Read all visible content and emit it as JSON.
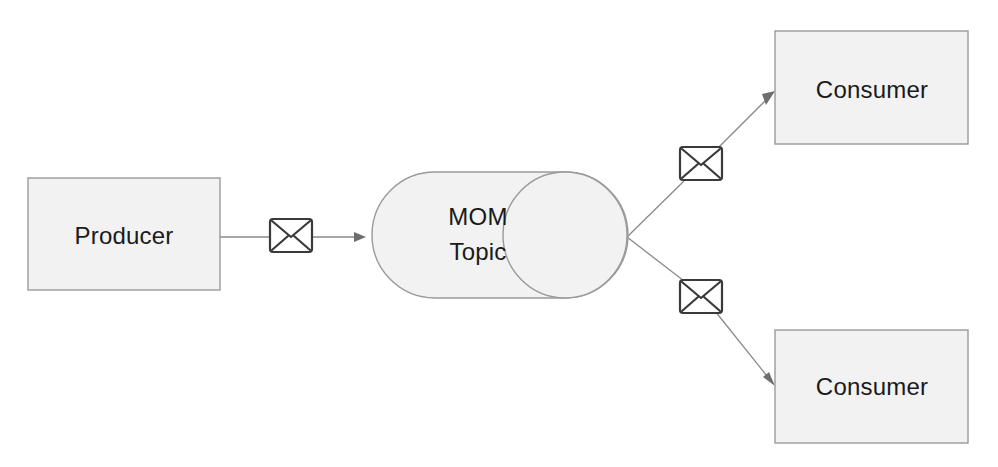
{
  "diagram": {
    "type": "flow-diagram",
    "colors": {
      "node_fill": "#f2f2f2",
      "node_stroke": "#9a9a9a",
      "connector": "#8a8a8a",
      "icon_stroke": "#3a3a3a",
      "text": "#1a1a1a",
      "background": "#ffffff"
    },
    "nodes": [
      {
        "id": "producer",
        "label": "Producer",
        "shape": "rectangle",
        "x": 28,
        "y": 178,
        "width": 192,
        "height": 112
      },
      {
        "id": "mom-topic",
        "label_line1": "MOM",
        "label_line2": "Topic",
        "shape": "cylinder",
        "x": 372,
        "y": 172,
        "width": 256,
        "height": 126
      },
      {
        "id": "consumer-top",
        "label": "Consumer",
        "shape": "rectangle",
        "x": 775,
        "y": 31,
        "width": 193,
        "height": 113
      },
      {
        "id": "consumer-bottom",
        "label": "Consumer",
        "shape": "rectangle",
        "x": 775,
        "y": 330,
        "width": 193,
        "height": 113
      }
    ],
    "icons": [
      {
        "id": "message-envelope-producer",
        "name": "envelope-icon",
        "x": 269,
        "y": 218,
        "width": 44,
        "height": 35,
        "rotation": 0
      },
      {
        "id": "message-envelope-top",
        "name": "envelope-icon",
        "x": 679,
        "y": 146,
        "width": 44,
        "height": 35,
        "rotation": 0
      },
      {
        "id": "message-envelope-bottom",
        "name": "envelope-icon",
        "x": 679,
        "y": 279,
        "width": 44,
        "height": 35,
        "rotation": 0
      }
    ],
    "connectors": [
      {
        "id": "producer-to-topic",
        "from": "producer",
        "to": "mom-topic",
        "arrow": true,
        "path": "M 220 237 L 366 237"
      },
      {
        "id": "topic-to-consumer-top",
        "from": "mom-topic",
        "to": "consumer-top",
        "arrow": true,
        "path": "M 627 237 L 772 93"
      },
      {
        "id": "topic-to-consumer-bottom",
        "from": "mom-topic",
        "to": "consumer-bottom",
        "arrow": true,
        "path": "M 627 237 L 772 384"
      }
    ]
  }
}
